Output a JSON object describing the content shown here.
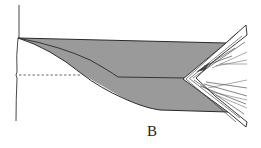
{
  "figure": {
    "panel_label": "B",
    "colors": {
      "fill": "#9a9a9a",
      "stroke": "#2a2a2a",
      "background": "#ffffff"
    }
  }
}
